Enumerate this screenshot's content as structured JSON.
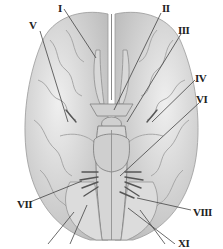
{
  "figure": {
    "colors": {
      "brain_fill": "#e4e4e4",
      "brain_shade": "#c8c8c8",
      "leader_line": "#444444",
      "label": "#222222"
    },
    "labels": [
      {
        "id": "I",
        "text": "I",
        "x": 58,
        "y": 3,
        "lx1": 64,
        "ly1": 9,
        "lx2": 96,
        "ly2": 58
      },
      {
        "id": "II",
        "text": "II",
        "x": 162,
        "y": 3,
        "lx1": 161,
        "ly1": 13,
        "lx2": 114,
        "ly2": 110
      },
      {
        "id": "III",
        "text": "III",
        "x": 178,
        "y": 25,
        "lx1": 181,
        "ly1": 34,
        "lx2": 127,
        "ly2": 122
      },
      {
        "id": "IV",
        "text": "IV",
        "x": 195,
        "y": 73,
        "lx1": 195,
        "ly1": 80,
        "lx2": 152,
        "ly2": 122
      },
      {
        "id": "V",
        "text": "V",
        "x": 29,
        "y": 20,
        "lx1": 40,
        "ly1": 31,
        "lx2": 68,
        "ly2": 122
      },
      {
        "id": "VI",
        "text": "VI",
        "x": 196,
        "y": 94,
        "lx1": 199,
        "ly1": 103,
        "lx2": 120,
        "ly2": 176
      },
      {
        "id": "VII",
        "text": "VII",
        "x": 17,
        "y": 199,
        "lx1": 30,
        "ly1": 202,
        "lx2": 82,
        "ly2": 181
      },
      {
        "id": "VIII",
        "text": "VIII",
        "x": 193,
        "y": 207,
        "lx1": 191,
        "ly1": 210,
        "lx2": 137,
        "ly2": 198
      },
      {
        "id": "XI",
        "text": "XI",
        "x": 178,
        "y": 238,
        "lx1": 175,
        "ly1": 244,
        "lx2": 128,
        "ly2": 208
      }
    ],
    "extra_leader_lines": [
      {
        "x1": 48,
        "y1": 244,
        "x2": 74,
        "y2": 212
      },
      {
        "x1": 70,
        "y1": 244,
        "x2": 87,
        "y2": 205
      },
      {
        "x1": 165,
        "y1": 244,
        "x2": 140,
        "y2": 210
      }
    ]
  }
}
